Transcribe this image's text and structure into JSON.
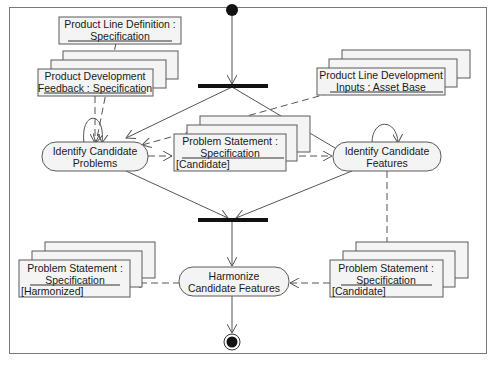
{
  "diagram": {
    "type": "UML activity diagram",
    "objects": [
      {
        "id": "pld",
        "line1": "Product Line Definition :",
        "line2": "Specification",
        "state": ""
      },
      {
        "id": "pdf",
        "line1": "Product Development",
        "line2": "Feedback : Specification",
        "state": ""
      },
      {
        "id": "plda",
        "line1": "Product Line Development",
        "line2": "Inputs : Asset Base",
        "state": ""
      },
      {
        "id": "ps_cand_mid",
        "line1": "Problem Statement :",
        "line2": "Specification",
        "state": "[Candidate]"
      },
      {
        "id": "ps_harm",
        "line1": "Problem Statement :",
        "line2": "Specification",
        "state": "[Harmonized]"
      },
      {
        "id": "ps_cand_right",
        "line1": "Problem Statement :",
        "line2": "Specification",
        "state": "[Candidate]"
      }
    ],
    "activities": [
      {
        "id": "icp",
        "line1": "Identify Candidate",
        "line2": "Problems"
      },
      {
        "id": "icf",
        "line1": "Identify Candidate",
        "line2": "Features"
      },
      {
        "id": "hcf",
        "line1": "Harmonize",
        "line2": "Candidate Features"
      }
    ],
    "nodes": {
      "initial": "initial-node",
      "fork": "fork-bar",
      "join": "join-bar",
      "final": "final-node"
    },
    "colors": {
      "line": "#555555",
      "fill": "#f4f4f4",
      "bar": "#111111"
    }
  }
}
